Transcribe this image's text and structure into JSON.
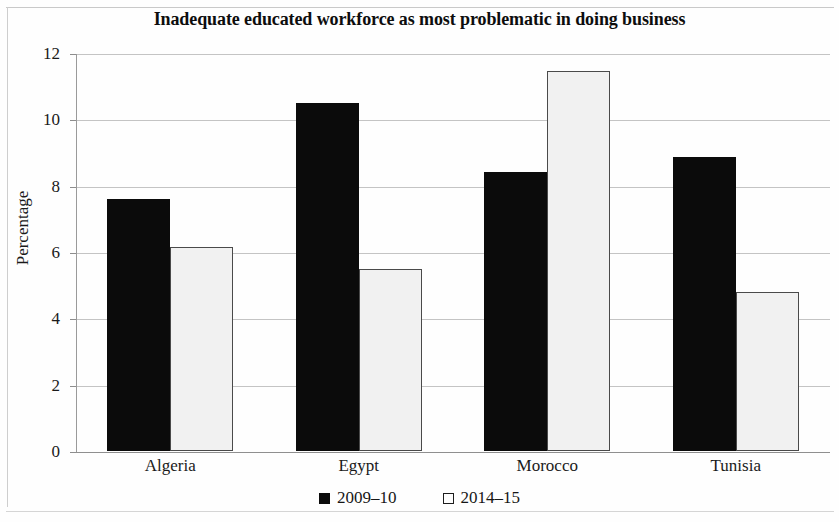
{
  "chart_data": {
    "type": "bar",
    "title": "Inadequate educated workforce as most problematic in doing business",
    "xlabel": "",
    "ylabel": "Percentage",
    "ylim": [
      0,
      12
    ],
    "yticks": [
      0,
      2,
      4,
      6,
      8,
      10,
      12
    ],
    "ytick_labels": [
      "0",
      "2",
      "4",
      "6",
      "8",
      "10",
      "12"
    ],
    "grid": true,
    "legend_position": "bottom",
    "categories": [
      "Algeria",
      "Egypt",
      "Morocco",
      "Tunisia"
    ],
    "series": [
      {
        "name": "2009–10",
        "color": "#0b0b0b",
        "style": "filled",
        "values": [
          7.6,
          10.5,
          8.4,
          8.85
        ]
      },
      {
        "name": "2014–15",
        "color": "#f1f1f1",
        "style": "hollow",
        "values": [
          6.15,
          5.5,
          11.45,
          4.8
        ]
      }
    ]
  },
  "legend": {
    "entries": [
      {
        "label": "2009–10",
        "swatch": "filled-square-icon"
      },
      {
        "label": "2014–15",
        "swatch": "hollow-square-icon"
      }
    ]
  }
}
